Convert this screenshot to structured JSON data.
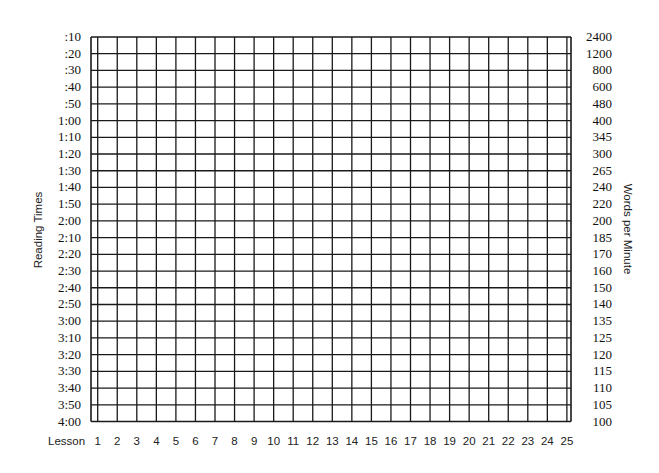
{
  "chart_data": {
    "type": "table",
    "title": "",
    "xlabel": "Lesson",
    "ylabel_left": "Reading Times",
    "ylabel_right": "Words per Minute",
    "x_ticks": [
      "1",
      "2",
      "3",
      "4",
      "5",
      "6",
      "7",
      "8",
      "9",
      "10",
      "11",
      "12",
      "13",
      "14",
      "15",
      "16",
      "17",
      "18",
      "19",
      "20",
      "21",
      "22",
      "23",
      "24",
      "25"
    ],
    "y_ticks_left": [
      ":10",
      ":20",
      ":30",
      ":40",
      ":50",
      "1:00",
      "1:10",
      "1:20",
      "1:30",
      "1:40",
      "1:50",
      "2:00",
      "2:10",
      "2:20",
      "2:30",
      "2:40",
      "2:50",
      "3:00",
      "3:10",
      "3:20",
      "3:30",
      "3:40",
      "3:50",
      "4:00"
    ],
    "y_ticks_right": [
      "2400",
      "1200",
      "800",
      "600",
      "480",
      "400",
      "345",
      "300",
      "265",
      "240",
      "220",
      "200",
      "185",
      "170",
      "160",
      "150",
      "140",
      "135",
      "125",
      "120",
      "115",
      "110",
      "105",
      "100"
    ],
    "grid": true,
    "series": [],
    "legend": null
  },
  "labels": {
    "lesson": "Lesson",
    "left_title": "Reading Times",
    "right_title": "Words per Minute"
  },
  "colors": {
    "grid_line": "#1a1a1a",
    "background": "#ffffff",
    "text": "#111111"
  }
}
